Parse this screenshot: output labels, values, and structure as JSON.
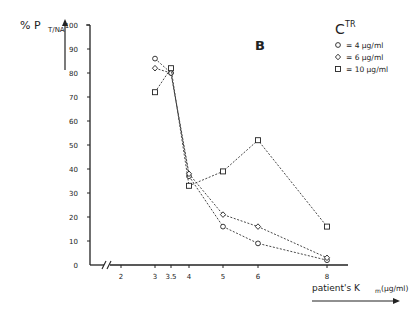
{
  "chart_data": {
    "type": "line",
    "panel_label": "B",
    "title": "",
    "ylabel_main": "% P",
    "ylabel_sub": "T/NA",
    "xlabel_main": "patient's K",
    "xlabel_sub": "m",
    "xlabel_unit": "(µg/ml)",
    "ylim": [
      0,
      100
    ],
    "yticks": [
      0,
      10,
      20,
      30,
      40,
      50,
      60,
      70,
      80,
      90,
      100
    ],
    "xticks": [
      2,
      3,
      3.5,
      4,
      5,
      6,
      8
    ],
    "xtick_labels": [
      "2",
      "3",
      "3.5",
      "4",
      "5",
      "6",
      "8"
    ],
    "axis_break": true,
    "grid": false,
    "legend": {
      "title_main": "C",
      "title_sup": "TR",
      "position": "top-right",
      "entries": [
        {
          "marker": "circle",
          "label": "= 4 µg/ml"
        },
        {
          "marker": "diamond",
          "label": "= 6 µg/ml"
        },
        {
          "marker": "square",
          "label": "= 10 µg/ml"
        }
      ]
    },
    "x": [
      3,
      3.5,
      4,
      5,
      6,
      8
    ],
    "series": [
      {
        "name": "4 µg/ml",
        "marker": "circle",
        "values": [
          86,
          80,
          37,
          16,
          9,
          2
        ]
      },
      {
        "name": "6 µg/ml",
        "marker": "diamond",
        "values": [
          82,
          80,
          38,
          21,
          16,
          3
        ]
      },
      {
        "name": "10 µg/ml",
        "marker": "square",
        "values": [
          72,
          82,
          33,
          39,
          52,
          16
        ]
      }
    ]
  }
}
